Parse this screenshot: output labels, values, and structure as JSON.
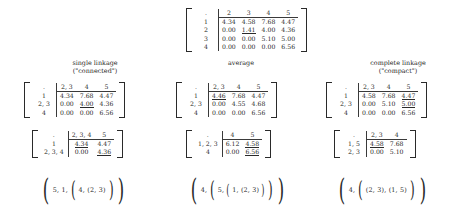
{
  "top_matrix": {
    "name": "initial distance matrix",
    "col_headers": [
      "2",
      "3",
      "4",
      "5"
    ],
    "row_labels": [
      "1",
      "2",
      "3",
      "4"
    ],
    "rows": [
      [
        {
          "v": "4.34"
        },
        {
          "v": "4.58"
        },
        {
          "v": "7.68"
        },
        {
          "v": "4.47"
        }
      ],
      [
        {
          "v": ""
        },
        {
          "v": "1.41",
          "u": true
        },
        {
          "v": "4.00"
        },
        {
          "v": "4.36"
        }
      ],
      [
        {
          "v": ""
        },
        {
          "v": ""
        },
        {
          "v": "5.10"
        },
        {
          "v": "5.00"
        }
      ],
      [
        {
          "v": ""
        },
        {
          "v": ""
        },
        {
          "v": ""
        },
        {
          "v": "6.56"
        }
      ]
    ]
  },
  "columns": [
    {
      "caption_line1": "single linkage",
      "caption_line2": "(\"connected\")",
      "step1": {
        "col_headers": [
          "2, 3",
          "4",
          "5"
        ],
        "row_labels": [
          "1",
          "2, 3",
          "4"
        ],
        "rows": [
          [
            {
              "v": "4.34"
            },
            {
              "v": "7.68"
            },
            {
              "v": "4.47"
            }
          ],
          [
            {
              "v": ""
            },
            {
              "v": "4.00",
              "u": true
            },
            {
              "v": "4.36"
            }
          ],
          [
            {
              "v": ""
            },
            {
              "v": ""
            },
            {
              "v": "6.56"
            }
          ]
        ]
      },
      "step2": {
        "col_headers": [
          "2, 3, 4",
          "5"
        ],
        "row_labels": [
          "1",
          "2, 3, 4"
        ],
        "rows": [
          [
            {
              "v": "4.34",
              "u": true
            },
            {
              "v": "4.47"
            }
          ],
          [
            {
              "v": ""
            },
            {
              "v": "4.36",
              "u": true
            }
          ]
        ]
      },
      "result": "( 5, 1, ( 4, (2, 3) ) )"
    },
    {
      "caption_line1": "average",
      "caption_line2": "",
      "step1": {
        "col_headers": [
          "2, 3",
          "4",
          "5"
        ],
        "row_labels": [
          "1",
          "2, 3",
          "4"
        ],
        "rows": [
          [
            {
              "v": "4.46",
              "u": true
            },
            {
              "v": "7.68"
            },
            {
              "v": "4.47"
            }
          ],
          [
            {
              "v": ""
            },
            {
              "v": "4.55"
            },
            {
              "v": "4.68"
            }
          ],
          [
            {
              "v": ""
            },
            {
              "v": ""
            },
            {
              "v": "6.56"
            }
          ]
        ]
      },
      "step2": {
        "col_headers": [
          "4",
          "5"
        ],
        "row_labels": [
          "1, 2, 3",
          "4"
        ],
        "rows": [
          [
            {
              "v": "6.12"
            },
            {
              "v": "4.58",
              "u": true
            }
          ],
          [
            {
              "v": ""
            },
            {
              "v": "6.56",
              "u": true
            }
          ]
        ]
      },
      "result": "( 4, ( 5, ( 1, (2, 3) ) ) )"
    },
    {
      "caption_line1": "complete linkage",
      "caption_line2": "(\"compact\")",
      "step1": {
        "col_headers": [
          "2, 3",
          "4",
          "5"
        ],
        "row_labels": [
          "1",
          "2, 3",
          "4"
        ],
        "rows": [
          [
            {
              "v": "4.58"
            },
            {
              "v": "7.68"
            },
            {
              "v": "4.47",
              "u": true
            }
          ],
          [
            {
              "v": ""
            },
            {
              "v": "5.10"
            },
            {
              "v": "5.00",
              "u": true
            }
          ],
          [
            {
              "v": ""
            },
            {
              "v": ""
            },
            {
              "v": "6.56"
            }
          ]
        ]
      },
      "step2": {
        "col_headers": [
          "2, 3",
          "4"
        ],
        "row_labels": [
          "1, 5",
          "2, 3"
        ],
        "rows": [
          [
            {
              "v": "4.58",
              "u": true
            },
            {
              "v": "7.68"
            }
          ],
          [
            {
              "v": ""
            },
            {
              "v": "5.10"
            }
          ]
        ]
      },
      "result": "( 4, ( (2, 3), (1, 5) ) )"
    }
  ],
  "results_tokens": [
    {
      "name": "single-linkage-result",
      "parts": [
        {
          "t": "open",
          "size": "p1"
        },
        {
          "t": "text",
          "v": "5, 1,"
        },
        {
          "t": "open",
          "size": "p2"
        },
        {
          "t": "text",
          "v": "4, (2, 3)"
        },
        {
          "t": "close",
          "size": "p2"
        },
        {
          "t": "close",
          "size": "p1"
        }
      ]
    },
    {
      "name": "average-linkage-result",
      "parts": [
        {
          "t": "open",
          "size": "p1"
        },
        {
          "t": "text",
          "v": "4,"
        },
        {
          "t": "open",
          "size": "p2"
        },
        {
          "t": "text",
          "v": "5,"
        },
        {
          "t": "open",
          "size": "p3"
        },
        {
          "t": "text",
          "v": "1, (2, 3)"
        },
        {
          "t": "close",
          "size": "p3"
        },
        {
          "t": "close",
          "size": "p2"
        },
        {
          "t": "close",
          "size": "p1"
        }
      ]
    },
    {
      "name": "complete-linkage-result",
      "parts": [
        {
          "t": "open",
          "size": "p1"
        },
        {
          "t": "text",
          "v": "4,"
        },
        {
          "t": "open",
          "size": "p2"
        },
        {
          "t": "text",
          "v": "(2, 3), (1, 5)"
        },
        {
          "t": "close",
          "size": "p2"
        },
        {
          "t": "close",
          "size": "p1"
        }
      ]
    }
  ],
  "colors": {
    "background": "#ffffff",
    "text": "#1f1f1f",
    "rule": "#3a3a3a"
  }
}
